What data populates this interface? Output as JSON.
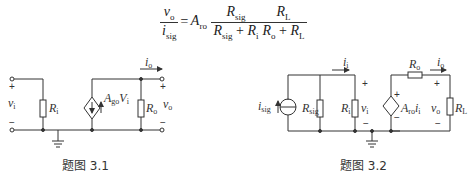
{
  "equation": {
    "lhs_num": "v",
    "lhs_num_sub": "o",
    "lhs_den": "i",
    "lhs_den_sub": "sig",
    "eq": "=",
    "gain": "A",
    "gain_sub": "ro",
    "f1_num": "R",
    "f1_num_sub": "sig",
    "f1_den_a": "R",
    "f1_den_a_sub": "sig",
    "f1_plus": " + ",
    "f1_den_b": "R",
    "f1_den_b_sub": "i",
    "f2_num": "R",
    "f2_num_sub": "L",
    "f2_den_a": "R",
    "f2_den_a_sub": "o",
    "f2_plus": " + ",
    "f2_den_b": "R",
    "f2_den_b_sub": "L"
  },
  "figure1": {
    "caption": "题图 3.1",
    "labels": {
      "vi": "v",
      "vi_sub": "i",
      "Ri": "R",
      "Ri_sub": "i",
      "source": "A",
      "source_sub": "go",
      "source_tail": "V",
      "source_tail_sub": "i",
      "Ro": "R",
      "Ro_sub": "o",
      "vo": "v",
      "vo_sub": "o",
      "io": "i",
      "io_sub": "o",
      "plus": "+",
      "minus": "−"
    }
  },
  "figure2": {
    "caption": "题图 3.2",
    "labels": {
      "isig": "i",
      "isig_sub": "sig",
      "Rsig": "R",
      "Rsig_sub": "sig",
      "Ri": "R",
      "Ri_sub": "i",
      "vi": "v",
      "vi_sub": "i",
      "ii": "i",
      "ii_sub": "i",
      "source": "A",
      "source_sub": "ro",
      "source_tail": "i",
      "source_tail_sub": "i",
      "Ro": "R",
      "Ro_sub": "o",
      "io": "i",
      "io_sub": "o",
      "vo": "v",
      "vo_sub": "o",
      "RL": "R",
      "RL_sub": "L",
      "plus": "+",
      "minus": "−"
    }
  }
}
